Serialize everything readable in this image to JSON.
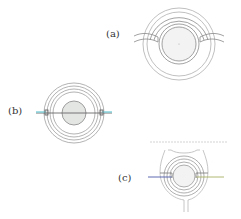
{
  "figure": {
    "panels": [
      {
        "id": "a",
        "label": "(a)"
      },
      {
        "id": "b",
        "label": "(b)"
      },
      {
        "id": "c",
        "label": "(c)"
      }
    ]
  },
  "colors": {
    "stroke": "#7a7a7a",
    "core_fill": "#e4e6e4",
    "blue_line": "#4a5aa8",
    "green_line": "#a8b060",
    "cyan_line": "#7fd0d8"
  }
}
